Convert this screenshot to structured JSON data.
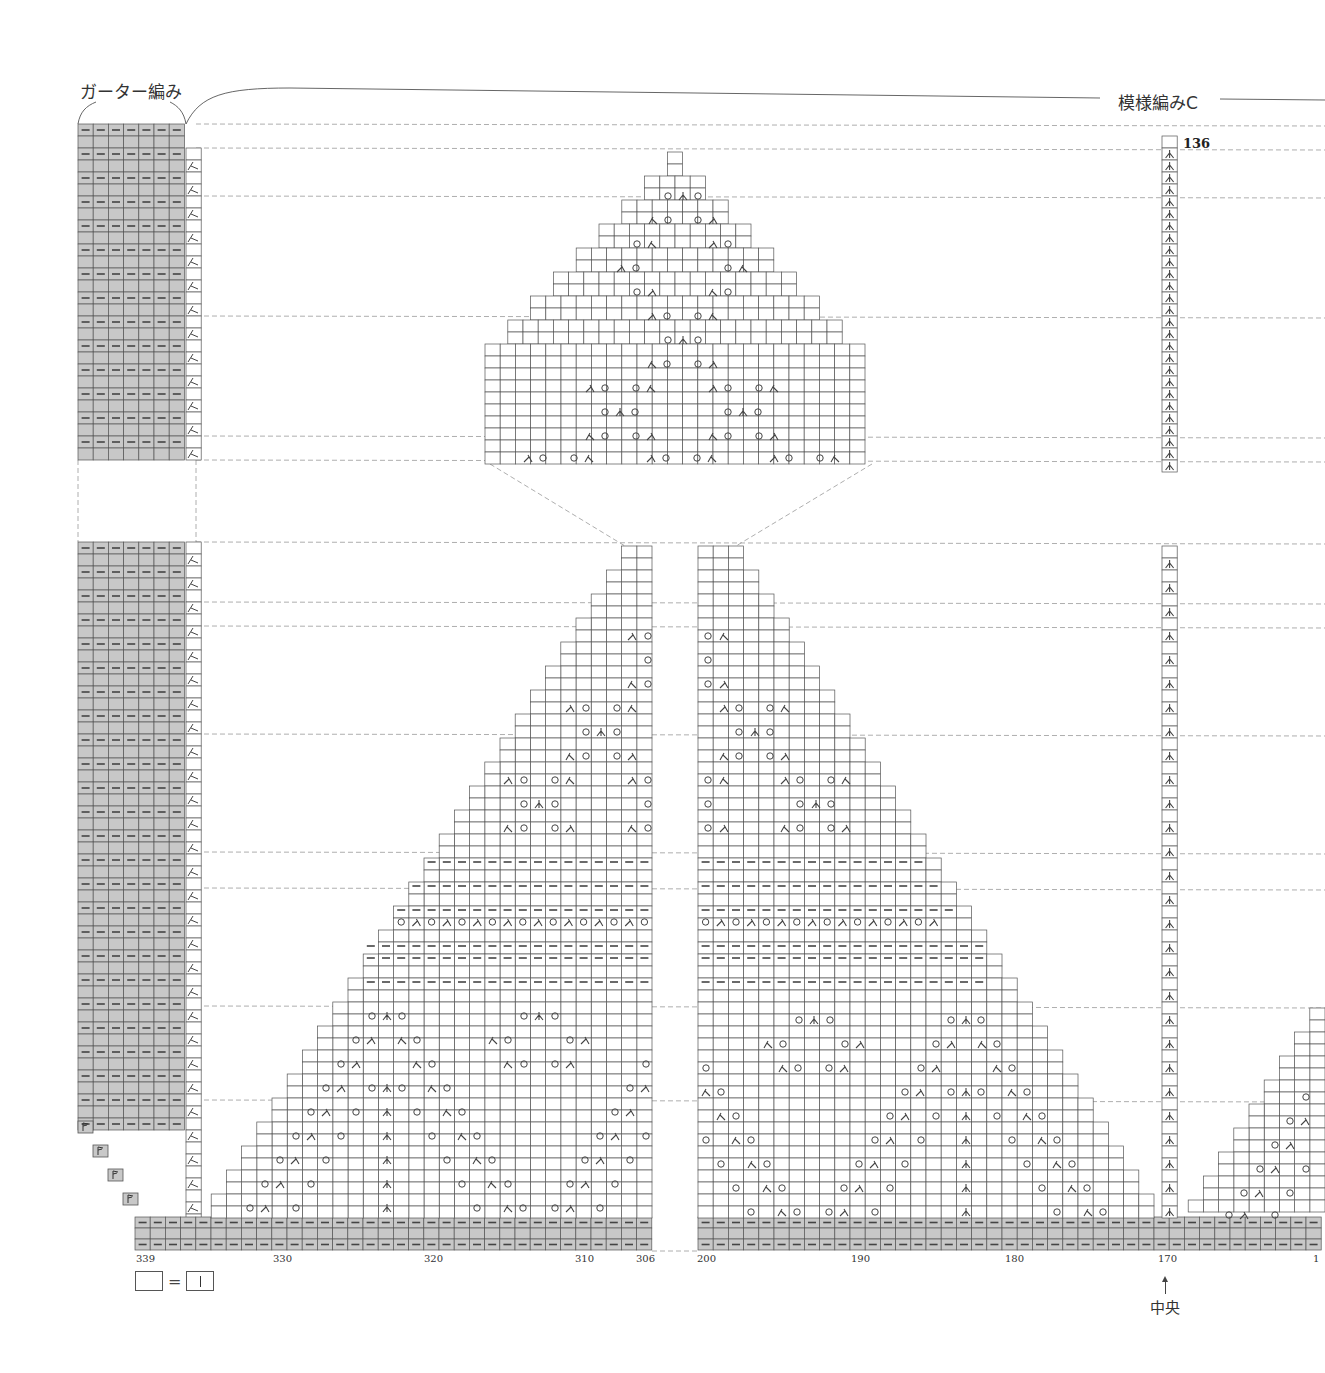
{
  "header": {
    "left_section_label": "ガーター編み",
    "right_section_label": "模様編みC"
  },
  "legend": {
    "blank_cell_meaning": "=",
    "knit_symbol": "|"
  },
  "center_marker": {
    "label": "中央",
    "column": 170
  },
  "row_label": "136",
  "column_labels": [
    {
      "text": "339",
      "x": 136
    },
    {
      "text": "330",
      "x": 273
    },
    {
      "text": "320",
      "x": 424
    },
    {
      "text": "310",
      "x": 575
    },
    {
      "text": "306",
      "x": 636
    },
    {
      "text": "200",
      "x": 697
    },
    {
      "text": "190",
      "x": 851
    },
    {
      "text": "180",
      "x": 1005
    },
    {
      "text": "170",
      "x": 1158
    },
    {
      "text": "1",
      "x": 1313
    }
  ],
  "colors": {
    "grid_line": "#555555",
    "garter_fill": "#c8c8c8",
    "symbol": "#444444",
    "dashed_guide": "#999999",
    "background": "#ffffff"
  },
  "symbols": {
    "yo": "O (yarn over)",
    "k2tog_right": "⋌ right-leaning decrease",
    "k2tog_left": "⋋ left-leaning decrease",
    "cdd": "central double decrease",
    "purl": "— purl"
  },
  "chart_data": {
    "type": "knitting_chart",
    "cell_w": 15.2,
    "row_h": 12,
    "sections": [
      {
        "name": "garter_top",
        "x": 78,
        "y": 124,
        "cols": 7,
        "rows": 28,
        "fill": "garter"
      },
      {
        "name": "garter_bottom",
        "x": 78,
        "y": 542,
        "cols": 7,
        "rows": 49,
        "fill": "garter"
      },
      {
        "name": "bottom_border_left",
        "x": 135,
        "y": 1217,
        "cols": 34,
        "rows": 3,
        "fill": "garter"
      },
      {
        "name": "bottom_border_right",
        "x": 698,
        "y": 1217,
        "cols": 41,
        "rows": 3,
        "fill": "garter"
      }
    ],
    "upper_triangle": {
      "apex_x": 675,
      "apex_y": 152,
      "base_y": 464,
      "base_left": 490,
      "base_right": 872
    },
    "left_triangle": {
      "right_x": 652,
      "top_y": 546,
      "base_y": 1217,
      "base_left": 196
    },
    "right_triangle": {
      "left_x": 698,
      "top_y": 546,
      "base_y": 1217,
      "base_right": 1150
    },
    "center_column": {
      "x": 1162,
      "top_y": 136,
      "bottom_y": 1217,
      "symbol": "cdd"
    },
    "far_right_triangle": {
      "right_x": 1325,
      "top_y": 1008,
      "base_y": 1217,
      "base_left": 1190
    },
    "side_decrease_column": {
      "x": 186,
      "symbol": "k2tog_right"
    }
  }
}
